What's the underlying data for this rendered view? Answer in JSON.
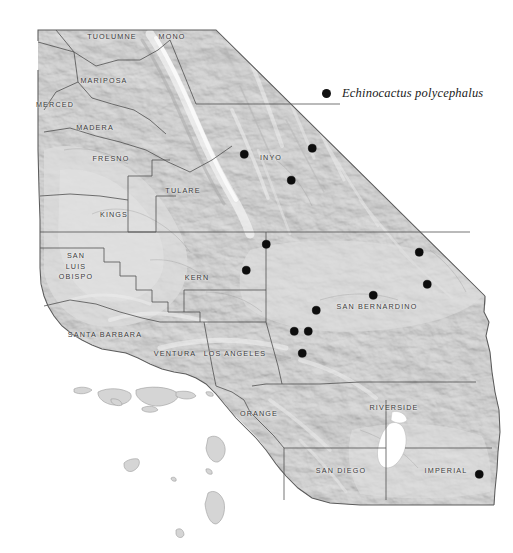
{
  "figure": {
    "type": "species-distribution-map",
    "region": "Southern and Central California",
    "background_color": "#ffffff",
    "terrain_style": "grayscale shaded relief"
  },
  "legend": {
    "symbol": "filled-circle",
    "symbol_color": "#111111",
    "species_label": "Echinocactus polycephalus",
    "x": 322,
    "y": 86
  },
  "counties": [
    {
      "name": "TUOLUMNE",
      "x": 112,
      "y": 36,
      "lines": [
        "TUOLUMNE"
      ]
    },
    {
      "name": "MONO",
      "x": 172,
      "y": 36,
      "lines": [
        "MONO"
      ]
    },
    {
      "name": "MARIPOSA",
      "x": 104,
      "y": 80,
      "lines": [
        "MARIPOSA"
      ]
    },
    {
      "name": "MERCED",
      "x": 55,
      "y": 104,
      "lines": [
        "MERCED"
      ]
    },
    {
      "name": "MADERA",
      "x": 95,
      "y": 127,
      "lines": [
        "MADERA"
      ]
    },
    {
      "name": "FRESNO",
      "x": 111,
      "y": 158,
      "lines": [
        "FRESNO"
      ]
    },
    {
      "name": "TULARE",
      "x": 183,
      "y": 190,
      "lines": [
        "TULARE"
      ]
    },
    {
      "name": "KINGS",
      "x": 114,
      "y": 214,
      "lines": [
        "KINGS"
      ]
    },
    {
      "name": "INYO",
      "x": 271,
      "y": 157,
      "lines": [
        "INYO"
      ]
    },
    {
      "name": "SAN LUIS OBISPO",
      "x": 76,
      "y": 267,
      "lines": [
        "SAN",
        "LUIS",
        "OBISPO"
      ]
    },
    {
      "name": "KERN",
      "x": 197,
      "y": 277,
      "lines": [
        "KERN"
      ]
    },
    {
      "name": "SAN BERNARDINO",
      "x": 377,
      "y": 306,
      "lines": [
        "SAN BERNARDINO"
      ]
    },
    {
      "name": "SANTA BARBARA",
      "x": 105,
      "y": 334,
      "lines": [
        "SANTA BARBARA"
      ]
    },
    {
      "name": "VENTURA",
      "x": 175,
      "y": 353,
      "lines": [
        "VENTURA"
      ]
    },
    {
      "name": "LOS ANGELES",
      "x": 235,
      "y": 353,
      "lines": [
        "LOS ANGELES"
      ]
    },
    {
      "name": "ORANGE",
      "x": 259,
      "y": 413,
      "lines": [
        "ORANGE"
      ]
    },
    {
      "name": "RIVERSIDE",
      "x": 394,
      "y": 407,
      "lines": [
        "RIVERSIDE"
      ]
    },
    {
      "name": "SAN DIEGO",
      "x": 341,
      "y": 470,
      "lines": [
        "SAN DIEGO"
      ]
    },
    {
      "name": "IMPERIAL",
      "x": 446,
      "y": 470,
      "lines": [
        "IMPERIAL"
      ]
    }
  ],
  "occurrences": {
    "symbol_count": 16,
    "points": [
      {
        "x": 244,
        "y": 154
      },
      {
        "x": 312,
        "y": 148
      },
      {
        "x": 291,
        "y": 180
      },
      {
        "x": 266,
        "y": 244
      },
      {
        "x": 246,
        "y": 270
      },
      {
        "x": 419,
        "y": 252
      },
      {
        "x": 427,
        "y": 284
      },
      {
        "x": 373,
        "y": 295
      },
      {
        "x": 316,
        "y": 310
      },
      {
        "x": 294,
        "y": 331
      },
      {
        "x": 308,
        "y": 331
      },
      {
        "x": 302,
        "y": 353
      },
      {
        "x": 479,
        "y": 474
      }
    ]
  }
}
